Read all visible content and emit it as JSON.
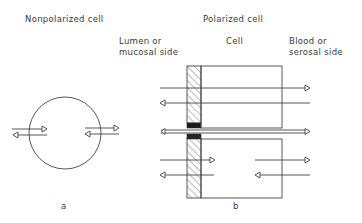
{
  "left_panel": {
    "title": "Nonpolarized cell",
    "caption": "a"
  },
  "right_panel": {
    "title": "Polarized cell",
    "lumen_label_line1": "Lumen or",
    "lumen_label_line2": "mucosal side",
    "cell_label": "Cell",
    "blood_label_line1": "Blood or",
    "blood_label_line2": "serosal side",
    "caption": "b"
  },
  "icons": {
    "arrow_head": "open-triangle"
  },
  "colors": {
    "line": "#444444",
    "junction": "#1a1a1a",
    "background": "#ffffff"
  }
}
